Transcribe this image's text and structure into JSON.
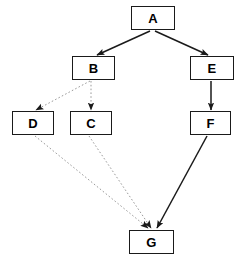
{
  "diagram": {
    "type": "node-link-diagram",
    "canvas": {
      "width": 243,
      "height": 260
    },
    "colors": {
      "background": "#ffffff",
      "node_fill": "#ffffff",
      "node_border": "#1a1a1a",
      "label": "#000000",
      "solid_edge": "#1a1a1a",
      "dotted_edge": "#9a9a9a"
    },
    "nodes": [
      {
        "id": "A",
        "label": "A",
        "x": 131,
        "y": 6,
        "w": 44,
        "h": 24
      },
      {
        "id": "B",
        "label": "B",
        "x": 72,
        "y": 56,
        "w": 43,
        "h": 24
      },
      {
        "id": "E",
        "label": "E",
        "x": 190,
        "y": 56,
        "w": 44,
        "h": 24
      },
      {
        "id": "D",
        "label": "D",
        "x": 12,
        "y": 111,
        "w": 42,
        "h": 24
      },
      {
        "id": "C",
        "label": "C",
        "x": 70,
        "y": 111,
        "w": 42,
        "h": 24
      },
      {
        "id": "F",
        "label": "F",
        "x": 190,
        "y": 111,
        "w": 41,
        "h": 24
      },
      {
        "id": "G",
        "label": "G",
        "x": 129,
        "y": 230,
        "w": 45,
        "h": 24
      }
    ],
    "edges": [
      {
        "id": "A-B",
        "from": "A",
        "to": "B",
        "style": "solid",
        "arrow": true,
        "x1": 150,
        "y1": 31,
        "x2": 97,
        "y2": 55
      },
      {
        "id": "A-E",
        "from": "A",
        "to": "E",
        "style": "solid",
        "arrow": true,
        "x1": 155,
        "y1": 31,
        "x2": 208,
        "y2": 55
      },
      {
        "id": "B-D",
        "from": "B",
        "to": "D",
        "style": "dotted",
        "arrow": true,
        "x1": 90,
        "y1": 81,
        "x2": 36,
        "y2": 110
      },
      {
        "id": "B-C",
        "from": "B",
        "to": "C",
        "style": "dotted",
        "arrow": true,
        "x1": 91,
        "y1": 81,
        "x2": 91,
        "y2": 110
      },
      {
        "id": "E-F",
        "from": "E",
        "to": "F",
        "style": "solid",
        "arrow": true,
        "x1": 211,
        "y1": 81,
        "x2": 211,
        "y2": 110
      },
      {
        "id": "D-G",
        "from": "D",
        "to": "G",
        "style": "dotted",
        "arrow": true,
        "x1": 35,
        "y1": 136,
        "x2": 148,
        "y2": 228
      },
      {
        "id": "C-G",
        "from": "C",
        "to": "G",
        "style": "dotted",
        "arrow": true,
        "x1": 89,
        "y1": 136,
        "x2": 151,
        "y2": 228
      },
      {
        "id": "F-G",
        "from": "F",
        "to": "G",
        "style": "solid",
        "arrow": true,
        "x1": 207,
        "y1": 136,
        "x2": 157,
        "y2": 228
      }
    ]
  }
}
